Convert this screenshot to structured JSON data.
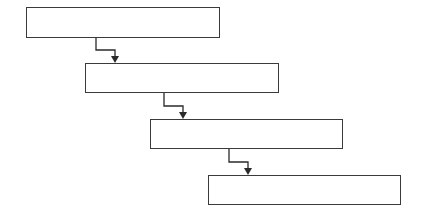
{
  "diagram": {
    "type": "cascade-flow",
    "line_color": "#2a2a2a",
    "border_color": "#3a3a3a",
    "boxes": [
      {
        "id": "step-1",
        "label": "",
        "x": 26,
        "y": 7,
        "w": 194,
        "h": 30
      },
      {
        "id": "step-2",
        "label": "",
        "x": 85,
        "y": 63,
        "w": 194,
        "h": 30
      },
      {
        "id": "step-3",
        "label": "",
        "x": 150,
        "y": 119,
        "w": 193,
        "h": 30
      },
      {
        "id": "step-4",
        "label": "",
        "x": 208,
        "y": 175,
        "w": 193,
        "h": 30
      }
    ],
    "connectors": [
      {
        "from": "step-1",
        "to": "step-2",
        "x1": 96,
        "y1": 37,
        "ymid": 50,
        "x2": 115,
        "y2": 63
      },
      {
        "from": "step-2",
        "to": "step-3",
        "x1": 164,
        "y1": 93,
        "ymid": 106,
        "x2": 183,
        "y2": 119
      },
      {
        "from": "step-3",
        "to": "step-4",
        "x1": 229,
        "y1": 149,
        "ymid": 162,
        "x2": 248,
        "y2": 175
      }
    ]
  }
}
